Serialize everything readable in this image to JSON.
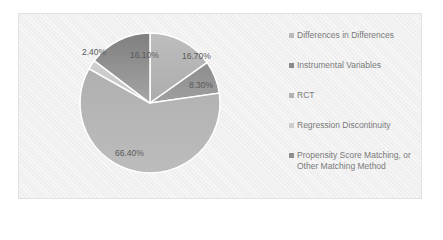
{
  "chart_data": {
    "type": "pie",
    "title": "",
    "categories": [
      "Differences in Differences",
      "Instrumental Variables",
      "RCT",
      "Regression Discontinuity",
      "Propensity Score Matching, or Other Matching Method"
    ],
    "values": [
      16.7,
      8.3,
      66.4,
      2.4,
      16.1
    ],
    "labels": [
      "16.70%",
      "8.30%",
      "66.40%",
      "2.40%",
      "16.10%"
    ],
    "colors": [
      "#b9b9b9",
      "#8f8f8f",
      "#b3b3b3",
      "#cdcdcd",
      "#8a8a8a"
    ],
    "legend_position": "right",
    "start_angle_deg": 0,
    "direction": "clockwise"
  },
  "legend": {
    "items": [
      {
        "label": "Differences in Differences",
        "color": "#b9b9b9"
      },
      {
        "label": "Instrumental Variables",
        "color": "#8a8a8a"
      },
      {
        "label": "RCT",
        "color": "#b3b3b3"
      },
      {
        "label": "Regression Discontinuity",
        "color": "#cdcdcd"
      },
      {
        "label": "Propensity Score Matching, or Other Matching Method",
        "color": "#8f8f8f"
      }
    ]
  }
}
